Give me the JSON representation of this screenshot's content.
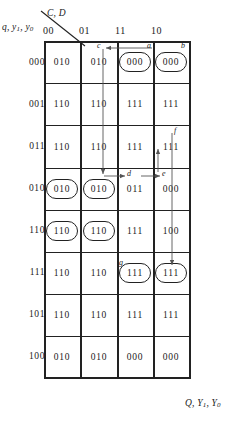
{
  "diagram": {
    "title_col_vars": "C, D",
    "title_row_vars": "q, y₁, y₀",
    "output_vars": "Q, Y₁, Y₀",
    "column_headers": [
      "00",
      "01",
      "11",
      "10"
    ],
    "row_headers": [
      "000",
      "001",
      "011",
      "010",
      "110",
      "111",
      "101",
      "100"
    ],
    "rows": [
      {
        "label": "000",
        "cells": [
          "010",
          "010",
          "000",
          "000"
        ]
      },
      {
        "label": "001",
        "cells": [
          "110",
          "110",
          "111",
          "111"
        ]
      },
      {
        "label": "011",
        "cells": [
          "110",
          "110",
          "111",
          "111"
        ]
      },
      {
        "label": "010",
        "cells": [
          "010",
          "010",
          "011",
          "000"
        ]
      },
      {
        "label": "110",
        "cells": [
          "110",
          "110",
          "111",
          "100"
        ]
      },
      {
        "label": "111",
        "cells": [
          "110",
          "110",
          "111",
          "111"
        ]
      },
      {
        "label": "101",
        "cells": [
          "110",
          "110",
          "111",
          "111"
        ]
      },
      {
        "label": "100",
        "cells": [
          "010",
          "010",
          "000",
          "000"
        ]
      }
    ],
    "ovals": [
      {
        "row": 0,
        "col": 2,
        "value": "000"
      },
      {
        "row": 0,
        "col": 3,
        "value": "000"
      },
      {
        "row": 3,
        "col": 0,
        "value": "010"
      },
      {
        "row": 3,
        "col": 1,
        "value": "010"
      },
      {
        "row": 4,
        "col": 0,
        "value": "110"
      },
      {
        "row": 4,
        "col": 1,
        "value": "110"
      },
      {
        "row": 5,
        "col": 2,
        "value": "111"
      },
      {
        "row": 5,
        "col": 3,
        "value": "111"
      }
    ],
    "arc_labels": [
      {
        "name": "a",
        "text": "a"
      },
      {
        "name": "b",
        "text": "b"
      },
      {
        "name": "c",
        "text": "c"
      },
      {
        "name": "d",
        "text": "d"
      },
      {
        "name": "e",
        "text": "e"
      },
      {
        "name": "f",
        "text": "f"
      },
      {
        "name": "g",
        "text": "g"
      }
    ],
    "colors": {
      "grid": "#222222",
      "text": "#1a1a1a",
      "arrow": "#555555",
      "background": "#ffffff"
    }
  }
}
